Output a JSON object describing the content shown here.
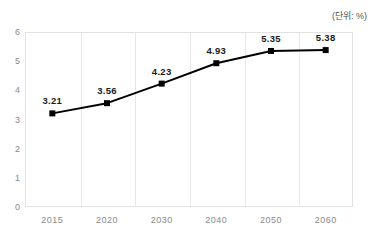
{
  "header": {
    "title": "",
    "unit_label": "(단위: %)"
  },
  "chart_data": {
    "type": "line",
    "title": "",
    "subtitle": "",
    "unit": "(단위: %)",
    "xlabel": "",
    "ylabel": "",
    "categories": [
      "2015",
      "2020",
      "2030",
      "2040",
      "2050",
      "2060"
    ],
    "values": [
      3.21,
      3.56,
      4.23,
      4.93,
      5.35,
      5.38
    ],
    "point_labels": [
      "3.21",
      "3.56",
      "4.23",
      "4.93",
      "5.35",
      "5.38"
    ],
    "series": [
      {
        "name": "",
        "values": [
          3.21,
          3.56,
          4.23,
          4.93,
          5.35,
          5.38
        ],
        "color": "#000000",
        "marker": "square"
      }
    ],
    "ylim": [
      0,
      6
    ],
    "yticks": [
      "0",
      "1",
      "2",
      "3",
      "4",
      "5",
      "6"
    ],
    "ytick_values": [
      0,
      1,
      2,
      3,
      4,
      5,
      6
    ],
    "xlim": [
      0,
      6
    ],
    "grid": {
      "vertical": true,
      "horizontal": false,
      "color": "#e8e8e8"
    },
    "legend": {
      "visible": false,
      "position": "none",
      "entries": []
    },
    "colors": {
      "line": "#000000",
      "marker": "#000000",
      "grid": "#e8e8e8",
      "axis_text": "#8a8a8a",
      "label_text": "#1a1a1a",
      "plot_border": "#e2e2e2",
      "background": "#ffffff"
    }
  }
}
